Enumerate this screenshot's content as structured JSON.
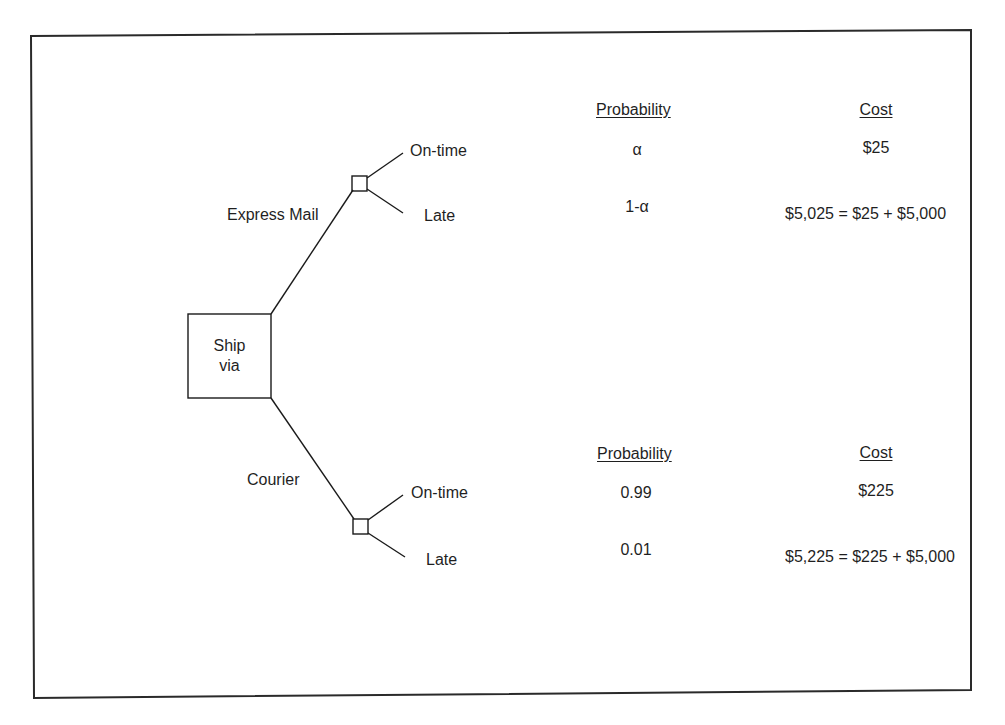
{
  "diagram": {
    "type": "decision-tree",
    "root": {
      "line1": "Ship",
      "line2": "via"
    },
    "branches": [
      {
        "label": "Express Mail",
        "outcomes": [
          {
            "label": "On-time",
            "probability": "α",
            "cost": "$25"
          },
          {
            "label": "Late",
            "probability": "1-α",
            "cost": "$5,025 = $25 + $5,000"
          }
        ],
        "headers": {
          "probability": "Probability",
          "cost": "Cost"
        }
      },
      {
        "label": "Courier",
        "outcomes": [
          {
            "label": "On-time",
            "probability": "0.99",
            "cost": "$225"
          },
          {
            "label": "Late",
            "probability": "0.01",
            "cost": "$5,225 = $225 + $5,000"
          }
        ],
        "headers": {
          "probability": "Probability",
          "cost": "Cost"
        }
      }
    ]
  },
  "colors": {
    "line": "#1a1a1a",
    "frame": "#2a2a2a",
    "background": "#ffffff"
  }
}
